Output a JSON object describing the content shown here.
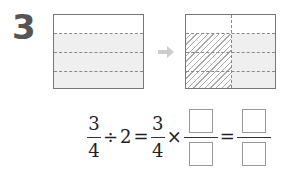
{
  "problem": {
    "number": "3"
  },
  "diagrams": {
    "left": {
      "rows": 4,
      "cols": 1,
      "shaded_rows": 3,
      "description": "rectangle divided into 4 horizontal parts, 3 shaded"
    },
    "arrow": "right-arrow",
    "right": {
      "rows": 4,
      "cols": 2,
      "shaded_rows": 3,
      "hatched_col": 1,
      "description": "rectangle divided into 4 rows and 2 columns; 3 rows of left column hatched"
    }
  },
  "equation": {
    "frac1": {
      "numerator": "3",
      "denominator": "4"
    },
    "div_sign": "÷",
    "divisor": "2",
    "eq1": "=",
    "frac2": {
      "numerator": "3",
      "denominator": "4"
    },
    "times_sign": "×",
    "frac3": {
      "numerator": "",
      "denominator": ""
    },
    "eq2": "=",
    "frac4": {
      "numerator": "",
      "denominator": ""
    }
  },
  "colors": {
    "number": "#555555",
    "border": "#777777",
    "shade": "#efefef",
    "arrow": "#cccccc"
  }
}
